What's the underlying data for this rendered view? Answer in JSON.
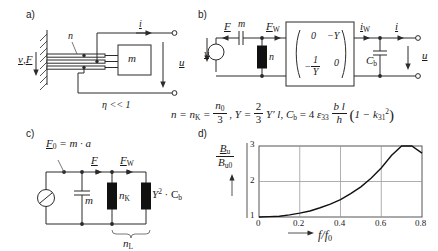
{
  "figure": {
    "panels": [
      {
        "tag": "a)",
        "caption_eta": "η << 1"
      },
      {
        "tag": "b)"
      },
      {
        "tag": "c)"
      },
      {
        "tag": "d)"
      }
    ]
  },
  "panel_a": {
    "tag": "a)",
    "label_vF": "v, F",
    "label_n": "n",
    "label_m": "m",
    "label_i": "i",
    "label_u": "u",
    "label_eta": "η << 1"
  },
  "panel_b": {
    "tag": "b)",
    "label_v": "v",
    "label_F": "F",
    "label_m": "m",
    "label_FW": "F",
    "label_FW_sub": "W",
    "label_n": "n",
    "label_iW": "i",
    "label_iW_sub": "W",
    "label_i": "i",
    "label_u": "u",
    "label_Cb": "C",
    "label_Cb_sub": "b",
    "matrix": {
      "r1c1": "0",
      "r1c2": "−Y",
      "r2c1_num": "1",
      "r2c1_den": "Y",
      "r2c1_sign": "−",
      "r2c2": "0"
    }
  },
  "formula": {
    "n_eq": "n = n",
    "n_sub": "K",
    "n_eq2": "=",
    "n0_num": "n",
    "n0_sub": "0",
    "n0_den": "3",
    "comma1": ",",
    "Y_eq": "Y =",
    "Y_num": "2",
    "Y_den": "3",
    "Y_tail": "Y′ l,",
    "Cb": "C",
    "Cb_sub": "b",
    "Cb_eq": "= 4",
    "eps": "ε",
    "eps_sub": "33",
    "bl_num": "b l",
    "bl_den": "h",
    "paren_open": "(",
    "one_minus": "1 − k",
    "k_sub": "31",
    "k_sup": "2",
    "paren_close": ")"
  },
  "panel_c": {
    "tag": "c)",
    "label_F0": "F",
    "label_F0_sub": "0",
    "label_F0_eq": "= m · a",
    "label_F": "F",
    "label_FW": "F",
    "label_FW_sub": "W",
    "label_m": "m",
    "label_nK": "n",
    "label_nK_sub": "K",
    "label_Y2Cb": "Y",
    "label_Y2Cb_sup": "2",
    "label_Y2Cb_tail": "· C",
    "label_Y2Cb_sub": "b",
    "label_nL": "n",
    "label_nL_sub": "L"
  },
  "panel_d": {
    "tag": "d)",
    "ylabel_num": "B",
    "ylabel_num_sub": "u",
    "ylabel_den": "B",
    "ylabel_den_sub": "u0",
    "xlabel": "f/f",
    "xlabel_sub": "0"
  },
  "chart_data": {
    "type": "line",
    "title": "",
    "xlabel": "f/f0",
    "ylabel": "Bu/Bu0",
    "xlim": [
      0,
      0.8
    ],
    "ylim": [
      1,
      3
    ],
    "xticks": [
      0,
      0.2,
      0.4,
      0.6,
      0.8
    ],
    "xticklabels": [
      "0",
      "0.2",
      "0.4",
      "0.6",
      "0.8"
    ],
    "yticks": [
      1,
      2,
      3
    ],
    "yticklabels": [
      "1",
      "2",
      "3"
    ],
    "grid": true,
    "legend": "none",
    "series": [
      {
        "name": "Bu/Bu0",
        "x": [
          0.0,
          0.05,
          0.1,
          0.15,
          0.2,
          0.25,
          0.3,
          0.35,
          0.4,
          0.45,
          0.5,
          0.55,
          0.6,
          0.65,
          0.7,
          0.75,
          0.8
        ],
        "y": [
          1.0,
          1.01,
          1.02,
          1.06,
          1.11,
          1.17,
          1.26,
          1.36,
          1.49,
          1.66,
          1.85,
          2.09,
          2.38,
          2.73,
          3.18,
          3.74,
          2.8
        ]
      }
    ]
  }
}
